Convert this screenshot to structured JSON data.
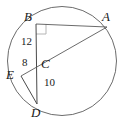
{
  "figure": {
    "type": "circle-geometry-diagram",
    "colors": {
      "background": "#ffffff",
      "stroke": "#4d4d4d",
      "chord_stroke": "#555555",
      "label_text": "#1a1a1a",
      "right_angle_marker": "#b0b0b0"
    },
    "circle": {
      "center_x": 62,
      "center_y": 61,
      "radius": 55
    },
    "points": [
      {
        "id": "A",
        "label": "A",
        "x": 107,
        "y": 27
      },
      {
        "id": "B",
        "label": "B",
        "x": 36,
        "y": 24
      },
      {
        "id": "C",
        "label": "C",
        "x": 36,
        "y": 64
      },
      {
        "id": "D",
        "label": "D",
        "x": 37,
        "y": 104
      },
      {
        "id": "E",
        "label": "E",
        "x": 21,
        "y": 76
      }
    ],
    "segments": [
      {
        "id": "BA",
        "from": "B",
        "to": "A"
      },
      {
        "id": "BD",
        "from": "B",
        "to": "D"
      },
      {
        "id": "EA",
        "from": "E",
        "to": "A"
      },
      {
        "id": "ED",
        "from": "E",
        "to": "D"
      }
    ],
    "measures": [
      {
        "id": "BC",
        "value": "12",
        "segment": "B to C"
      },
      {
        "id": "EC",
        "value": "8",
        "segment": "E to C"
      },
      {
        "id": "CD",
        "value": "10",
        "segment": "C to D"
      }
    ],
    "right_angle": {
      "at": "B",
      "between": "BA and BD"
    }
  }
}
